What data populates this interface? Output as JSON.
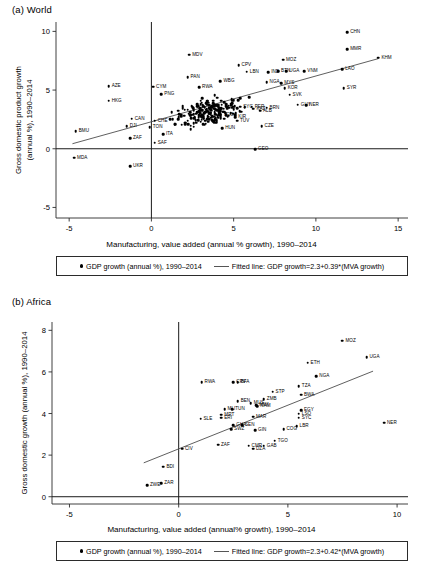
{
  "figure": {
    "panel_a_title": "(a) World",
    "panel_b_title": "(b) Africa"
  },
  "chart_data": [
    {
      "type": "scatter",
      "title": "(a) World",
      "xlabel": "Manufacturing, value added (annual % growth), 1990–2014",
      "ylabel_line1": "Gross domestic product growth",
      "ylabel_line2": "(annual %), 1990–2014",
      "xlim": [
        -5.8,
        15.6
      ],
      "ylim": [
        -5.9,
        10.8
      ],
      "xticks": [
        -5,
        0,
        5,
        10,
        15
      ],
      "yticks": [
        -5,
        0,
        5,
        10
      ],
      "grid": false,
      "legend_position": "bottom",
      "legend": {
        "marker_label": "GDP growth (annual %), 1990–2014",
        "line_label": "Fitted line: GDP growth=2.3+0.39*(MVA growth)"
      },
      "fit": {
        "intercept": 2.3,
        "slope": 0.39,
        "x_start": -4.8,
        "x_end": 13.8
      },
      "labeled_points": [
        {
          "code": "CHN",
          "x": 11.9,
          "y": 9.95,
          "lx": 3
        },
        {
          "code": "MMR",
          "x": 11.9,
          "y": 8.5,
          "lx": 3
        },
        {
          "code": "KHM",
          "x": 13.8,
          "y": 7.75,
          "lx": 3
        },
        {
          "code": "MOZ",
          "x": 8.0,
          "y": 7.6,
          "lx": 3
        },
        {
          "code": "MDV",
          "x": 2.3,
          "y": 8.0,
          "lx": 3
        },
        {
          "code": "CPV",
          "x": 5.3,
          "y": 7.1,
          "lx": 3
        },
        {
          "code": "BTN",
          "x": 7.7,
          "y": 6.6,
          "lx": 3
        },
        {
          "code": "UGA",
          "x": 8.2,
          "y": 6.6,
          "lx": 3
        },
        {
          "code": "VNM",
          "x": 9.3,
          "y": 6.6,
          "lx": 3
        },
        {
          "code": "LAO",
          "x": 11.6,
          "y": 6.8,
          "lx": 3
        },
        {
          "code": "LBN",
          "x": 5.8,
          "y": 6.55,
          "lx": 3
        },
        {
          "code": "IND",
          "x": 7.1,
          "y": 6.5,
          "lx": 3
        },
        {
          "code": "PAN",
          "x": 2.2,
          "y": 6.1,
          "lx": 3
        },
        {
          "code": "WBG",
          "x": 4.2,
          "y": 5.75,
          "lx": 3
        },
        {
          "code": "NGA",
          "x": 7.0,
          "y": 5.65,
          "lx": 3
        },
        {
          "code": "MYS",
          "x": 7.9,
          "y": 5.6,
          "lx": 3
        },
        {
          "code": "KOR",
          "x": 8.1,
          "y": 5.15,
          "lx": 3
        },
        {
          "code": "SYR",
          "x": 11.7,
          "y": 5.15,
          "lx": 3
        },
        {
          "code": "SVK",
          "x": 8.4,
          "y": 4.6,
          "lx": 3
        },
        {
          "code": "AZE",
          "x": -2.6,
          "y": 5.35,
          "lx": 3
        },
        {
          "code": "CYM",
          "x": 0.1,
          "y": 5.3,
          "lx": 3
        },
        {
          "code": "RWA",
          "x": 2.9,
          "y": 5.25,
          "lx": 3
        },
        {
          "code": "HKG",
          "x": -2.6,
          "y": 4.1,
          "lx": 3
        },
        {
          "code": "PNG",
          "x": 0.6,
          "y": 4.65,
          "lx": 3
        },
        {
          "code": "GUY",
          "x": 8.9,
          "y": 3.75,
          "lx": 3
        },
        {
          "code": "NER",
          "x": 9.4,
          "y": 3.7,
          "lx": 3
        },
        {
          "code": "ALB",
          "x": 6.6,
          "y": 3.25,
          "lx": 3
        },
        {
          "code": "KAZ",
          "x": 6.2,
          "y": 3.4,
          "lx": 3
        },
        {
          "code": "SYC",
          "x": 5.4,
          "y": 3.6,
          "lx": 3
        },
        {
          "code": "PER",
          "x": 6.1,
          "y": 3.6,
          "lx": 3
        },
        {
          "code": "BRN",
          "x": 7.0,
          "y": 3.5,
          "lx": 3
        },
        {
          "code": "KIR",
          "x": 5.1,
          "y": 2.7,
          "lx": 3
        },
        {
          "code": "TUV",
          "x": 5.2,
          "y": 2.4,
          "lx": 3
        },
        {
          "code": "TGO",
          "x": 4.2,
          "y": 2.9,
          "lx": 3
        },
        {
          "code": "CZE",
          "x": 6.7,
          "y": 1.9,
          "lx": 3
        },
        {
          "code": "HUN",
          "x": 4.3,
          "y": 1.75,
          "lx": 3
        },
        {
          "code": "GEO",
          "x": 6.3,
          "y": -0.05,
          "lx": 3
        },
        {
          "code": "CAN",
          "x": -1.2,
          "y": 2.55,
          "lx": 3
        },
        {
          "code": "CHE",
          "x": 0.2,
          "y": 2.4,
          "lx": 3
        },
        {
          "code": "DJI",
          "x": -1.5,
          "y": 1.9,
          "lx": 3
        },
        {
          "code": "TON",
          "x": -0.1,
          "y": 1.85,
          "lx": 3
        },
        {
          "code": "ITA",
          "x": 0.7,
          "y": 1.25,
          "lx": 3
        },
        {
          "code": "ZAF",
          "x": -1.3,
          "y": 0.9,
          "lx": 3
        },
        {
          "code": "SAF",
          "x": 0.2,
          "y": 0.5,
          "lx": 3
        },
        {
          "code": "BMU",
          "x": -4.6,
          "y": 1.5,
          "lx": 3
        },
        {
          "code": "MDA",
          "x": -4.7,
          "y": -0.75,
          "lx": 3
        },
        {
          "code": "UKR",
          "x": -1.3,
          "y": -1.5,
          "lx": 3
        }
      ],
      "cluster": {
        "note": "dense unlabeled scatter cloud",
        "n": 210,
        "x_center": 3.4,
        "y_center": 3.1,
        "x_spread": 1.9,
        "y_spread": 1.0
      }
    },
    {
      "type": "scatter",
      "title": "(b) Africa",
      "xlabel": "Manufacturing, value added (annual% growth), 1990–2014",
      "ylabel": "Gross domestic growth (annual %), 1990–2014",
      "xlim": [
        -5.8,
        10.5
      ],
      "ylim": [
        -0.35,
        8.4
      ],
      "xticks": [
        -5,
        0,
        5,
        10
      ],
      "yticks": [
        0,
        2,
        4,
        6,
        8
      ],
      "grid": false,
      "legend_position": "bottom",
      "legend": {
        "marker_label": "GDP growth (annual %), 1990–2014",
        "line_label": "Fitted line: GDP growth=2.3+0.42*(MVA growth)"
      },
      "fit": {
        "intercept": 2.3,
        "slope": 0.42,
        "x_start": -1.6,
        "x_end": 8.9
      },
      "labeled_points": [
        {
          "code": "MOZ",
          "x": 7.5,
          "y": 7.5,
          "lx": 3
        },
        {
          "code": "UGA",
          "x": 8.6,
          "y": 6.7,
          "lx": 3
        },
        {
          "code": "ETH",
          "x": 5.9,
          "y": 6.45,
          "lx": 3
        },
        {
          "code": "NGA",
          "x": 6.3,
          "y": 5.8,
          "lx": 3
        },
        {
          "code": "RWA",
          "x": 1.05,
          "y": 5.5,
          "lx": 3
        },
        {
          "code": "CPV",
          "x": 2.5,
          "y": 5.5,
          "lx": 3
        },
        {
          "code": "BFA",
          "x": 2.7,
          "y": 5.5,
          "lx": 3
        },
        {
          "code": "TZA",
          "x": 5.5,
          "y": 5.3,
          "lx": 3
        },
        {
          "code": "STP",
          "x": 4.3,
          "y": 5.05,
          "lx": 3
        },
        {
          "code": "BWA",
          "x": 5.6,
          "y": 4.9,
          "lx": 3
        },
        {
          "code": "ZMB",
          "x": 3.9,
          "y": 4.7,
          "lx": 3
        },
        {
          "code": "BEN",
          "x": 2.7,
          "y": 4.6,
          "lx": 3
        },
        {
          "code": "MUS",
          "x": 3.3,
          "y": 4.5,
          "lx": 3
        },
        {
          "code": "MWI",
          "x": 3.55,
          "y": 4.4,
          "lx": 3
        },
        {
          "code": "NAM",
          "x": 3.6,
          "y": 4.35,
          "lx": 3
        },
        {
          "code": "MLI",
          "x": 2.1,
          "y": 4.2,
          "lx": 3
        },
        {
          "code": "TUN",
          "x": 2.45,
          "y": 4.2,
          "lx": 3
        },
        {
          "code": "EGY",
          "x": 5.6,
          "y": 4.15,
          "lx": 3
        },
        {
          "code": "LSO",
          "x": 5.5,
          "y": 4.0,
          "lx": 3
        },
        {
          "code": "MRT",
          "x": 1.95,
          "y": 3.95,
          "lx": 3
        },
        {
          "code": "SYC",
          "x": 5.5,
          "y": 3.8,
          "lx": 3
        },
        {
          "code": "ERI",
          "x": 1.95,
          "y": 3.8,
          "lx": 3
        },
        {
          "code": "MAR",
          "x": 3.4,
          "y": 3.85,
          "lx": 3
        },
        {
          "code": "SLE",
          "x": 1.0,
          "y": 3.75,
          "lx": 3
        },
        {
          "code": "NER",
          "x": 9.4,
          "y": 3.55,
          "lx": 3
        },
        {
          "code": "LBR",
          "x": 5.4,
          "y": 3.4,
          "lx": 3
        },
        {
          "code": "GHA",
          "x": 2.5,
          "y": 3.45,
          "lx": 3
        },
        {
          "code": "SEN",
          "x": 2.9,
          "y": 3.45,
          "lx": 3
        },
        {
          "code": "SWZ",
          "x": 2.4,
          "y": 3.25,
          "lx": 3
        },
        {
          "code": "COG",
          "x": 4.8,
          "y": 3.25,
          "lx": 3
        },
        {
          "code": "GIN",
          "x": 3.5,
          "y": 3.2,
          "lx": 3
        },
        {
          "code": "TGO",
          "x": 4.4,
          "y": 2.7,
          "lx": 3
        },
        {
          "code": "GAB",
          "x": 3.9,
          "y": 2.45,
          "lx": 3
        },
        {
          "code": "CMR",
          "x": 3.2,
          "y": 2.45,
          "lx": 3
        },
        {
          "code": "ZAF",
          "x": 1.8,
          "y": 2.5,
          "lx": 3
        },
        {
          "code": "DZA",
          "x": 3.4,
          "y": 2.3,
          "lx": 3
        },
        {
          "code": "CIV",
          "x": 0.15,
          "y": 2.3,
          "lx": 3
        },
        {
          "code": "BDI",
          "x": -0.7,
          "y": 1.45,
          "lx": 3
        },
        {
          "code": "ZAR",
          "x": -0.8,
          "y": 0.65,
          "lx": 3
        },
        {
          "code": "ZWE",
          "x": -1.45,
          "y": 0.55,
          "lx": 3
        }
      ]
    }
  ]
}
